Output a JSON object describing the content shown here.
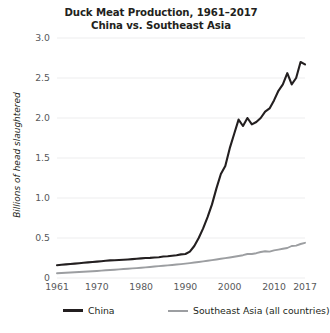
{
  "chart_data": {
    "type": "line",
    "title": "Duck Meat Production, 1961–2017",
    "subtitle": "China vs. Southeast Asia",
    "xlabel": "",
    "ylabel": "Billions of head slaughtered",
    "xlim": [
      1961,
      2017
    ],
    "ylim": [
      0,
      3.0
    ],
    "grid": true,
    "legend_position": "bottom",
    "ytick_labels": [
      "3.0",
      "2.5",
      "2.0",
      "1.5",
      "1.0",
      "0.5",
      "0"
    ],
    "ytick_values": [
      3.0,
      2.5,
      2.0,
      1.5,
      1.0,
      0.5,
      0
    ],
    "xtick_labels": [
      "1961",
      "1970",
      "1980",
      "1990",
      "2000",
      "2010",
      "2017"
    ],
    "xtick_values": [
      1961,
      1970,
      1980,
      1990,
      2000,
      2010,
      2017
    ],
    "x": [
      1961,
      1962,
      1963,
      1964,
      1965,
      1966,
      1967,
      1968,
      1969,
      1970,
      1971,
      1972,
      1973,
      1974,
      1975,
      1976,
      1977,
      1978,
      1979,
      1980,
      1981,
      1982,
      1983,
      1984,
      1985,
      1986,
      1987,
      1988,
      1989,
      1990,
      1991,
      1992,
      1993,
      1994,
      1995,
      1996,
      1997,
      1998,
      1999,
      2000,
      2001,
      2002,
      2003,
      2004,
      2005,
      2006,
      2007,
      2008,
      2009,
      2010,
      2011,
      2012,
      2013,
      2014,
      2015,
      2016,
      2017
    ],
    "series": [
      {
        "name": "China",
        "color": "#231f20",
        "values": [
          0.16,
          0.165,
          0.17,
          0.175,
          0.18,
          0.185,
          0.19,
          0.195,
          0.2,
          0.205,
          0.21,
          0.215,
          0.22,
          0.222,
          0.225,
          0.228,
          0.232,
          0.236,
          0.24,
          0.245,
          0.25,
          0.252,
          0.256,
          0.26,
          0.268,
          0.272,
          0.278,
          0.285,
          0.295,
          0.3,
          0.33,
          0.4,
          0.5,
          0.62,
          0.76,
          0.92,
          1.12,
          1.3,
          1.4,
          1.62,
          1.8,
          1.98,
          1.9,
          2.0,
          1.92,
          1.95,
          2.0,
          2.08,
          2.12,
          2.22,
          2.34,
          2.42,
          2.56,
          2.42,
          2.5,
          2.7,
          2.67
        ]
      },
      {
        "name": "Southeast Asia (all countries)",
        "color": "#9c9ea1",
        "values": [
          0.06,
          0.063,
          0.066,
          0.069,
          0.072,
          0.075,
          0.078,
          0.081,
          0.084,
          0.088,
          0.092,
          0.096,
          0.1,
          0.104,
          0.108,
          0.112,
          0.116,
          0.12,
          0.124,
          0.128,
          0.133,
          0.138,
          0.143,
          0.148,
          0.153,
          0.158,
          0.163,
          0.168,
          0.174,
          0.18,
          0.186,
          0.193,
          0.2,
          0.208,
          0.216,
          0.224,
          0.232,
          0.24,
          0.248,
          0.256,
          0.265,
          0.275,
          0.285,
          0.3,
          0.3,
          0.31,
          0.325,
          0.335,
          0.33,
          0.345,
          0.355,
          0.365,
          0.375,
          0.4,
          0.405,
          0.425,
          0.44
        ]
      }
    ]
  },
  "legend": {
    "items": [
      {
        "label": "China"
      },
      {
        "label": "Southeast Asia (all countries)"
      }
    ]
  }
}
